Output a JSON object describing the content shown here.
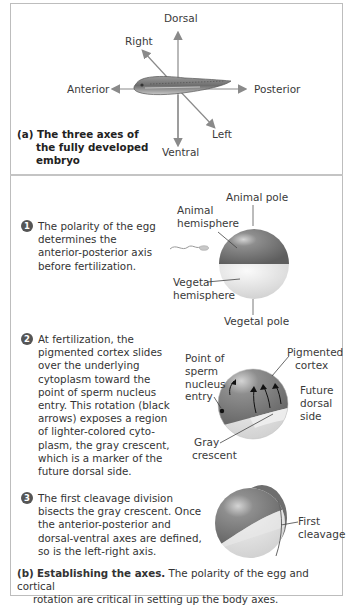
{
  "panel_a": {
    "axes": {
      "dorsal": "Dorsal",
      "ventral": "Ventral",
      "anterior": "Anterior",
      "posterior": "Posterior",
      "right": "Right",
      "left": "Left"
    },
    "caption": {
      "marker": "(a)",
      "lines": [
        "The three axes of",
        "the fully developed",
        "embryo"
      ]
    }
  },
  "panel_b": {
    "steps": [
      {
        "number": "1",
        "lines": [
          "The polarity of the egg",
          "determines the",
          "anterior-posterior axis",
          "before fertilization."
        ],
        "labels": {
          "animal_pole": "Animal pole",
          "animal_hemisphere": [
            "Animal",
            "hemisphere"
          ],
          "vegetal_hemisphere": [
            "Vegetal",
            "hemisphere"
          ],
          "vegetal_pole": "Vegetal pole"
        }
      },
      {
        "number": "2",
        "lines": [
          "At fertilization, the",
          "pigmented cortex slides",
          "over the underlying",
          "cytoplasm toward the",
          "point of sperm nucleus",
          "entry. This rotation (black",
          "arrows) exposes a region",
          "of lighter-colored cyto-",
          "plasm, the gray crescent,",
          "which is a marker of the",
          "future dorsal side."
        ],
        "labels": {
          "sperm_entry": [
            "Point of",
            "sperm",
            "nucleus",
            "entry"
          ],
          "pigmented_cortex": [
            "Pigmented",
            "cortex"
          ],
          "future_dorsal": [
            "Future",
            "dorsal",
            "side"
          ],
          "gray_crescent": [
            "Gray",
            "crescent"
          ]
        }
      },
      {
        "number": "3",
        "lines": [
          "The first cleavage division",
          "bisects the gray crescent. Once",
          "the anterior-posterior and",
          "dorsal-ventral axes are defined,",
          "so is the left-right axis."
        ],
        "labels": {
          "first_cleavage": [
            "First",
            "cleavage"
          ]
        }
      }
    ],
    "caption": {
      "marker": "(b)",
      "title": "Establishing the axes.",
      "line1": " The polarity of the egg and cortical",
      "line2": "rotation are critical in setting up the body axes."
    }
  },
  "colors": {
    "border": "#bdbdbd",
    "arrow": "#8a8a8a",
    "pigmented": "#7d7d7d",
    "vegetal": "#e6e6e6",
    "text": "#333333"
  }
}
